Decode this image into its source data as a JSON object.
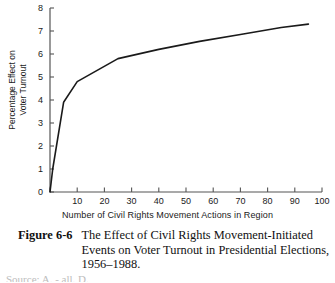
{
  "figure": {
    "caption_number": "Figure 6-6",
    "caption_text": "The Effect of Civil Rights Movement-Initiated Events on Voter Turnout in Presidential Elections, 1956–1988.",
    "cut_off_line": "Source: A. - all. D."
  },
  "chart_data": {
    "type": "line",
    "title": "",
    "xlabel": "Number of Civil Rights Movement Actions in Region",
    "ylabel": "Percentage Effect on Voter Turnout",
    "ylabel_lines": [
      "Percentage Effect on",
      "Voter Turnout"
    ],
    "xlim": [
      0,
      100
    ],
    "ylim": [
      0,
      8
    ],
    "xticks": [
      0,
      10,
      20,
      30,
      40,
      50,
      60,
      70,
      80,
      90,
      100
    ],
    "xtick_labels": [
      "",
      "10",
      "20",
      "30",
      "40",
      "50",
      "60",
      "70",
      "80",
      "90",
      "100"
    ],
    "yticks": [
      0,
      1,
      2,
      3,
      4,
      5,
      6,
      7,
      8
    ],
    "ytick_labels": [
      "0",
      "1",
      "2",
      "3",
      "4",
      "5",
      "6",
      "7",
      "8"
    ],
    "grid": false,
    "legend": false,
    "line_color": "#1a1a1a",
    "axis_color": "#555555",
    "series": [
      {
        "name": "Percentage effect on voter turnout",
        "x": [
          0,
          1,
          5,
          10,
          25,
          40,
          55,
          70,
          85,
          95
        ],
        "y": [
          0,
          1.0,
          3.9,
          4.8,
          5.8,
          6.2,
          6.55,
          6.85,
          7.15,
          7.3
        ]
      }
    ]
  }
}
